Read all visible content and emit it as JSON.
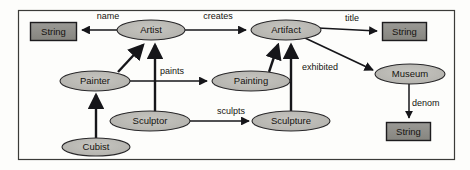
{
  "diagram": {
    "type": "entity-relationship-graph",
    "frame": {
      "name": "diagram-frame",
      "x": 18,
      "y": 10,
      "width": 436,
      "height": 150,
      "stroke": "#3b3b38",
      "fill": "#fdfdfb"
    },
    "colors": {
      "ellipse_fill": "#b9b8b3",
      "ellipse_stroke": "#29282a",
      "box_fill": "#8f8e8a",
      "box_stroke": "#1d1c1e",
      "edge_stroke": "#16161a",
      "text": "#15130f",
      "page_background": "#ffffff"
    },
    "nodes": [
      {
        "id": "string-name",
        "label": "String",
        "shape": "rectangle",
        "x": 30,
        "y": 22,
        "width": 46,
        "height": 18
      },
      {
        "id": "artist",
        "label": "Artist",
        "shape": "ellipse",
        "cx": 151,
        "cy": 30,
        "rx": 34,
        "ry": 10
      },
      {
        "id": "artifact",
        "label": "Artifact",
        "shape": "ellipse",
        "cx": 286,
        "cy": 30,
        "rx": 35,
        "ry": 10
      },
      {
        "id": "string-title",
        "label": "String",
        "shape": "rectangle",
        "x": 382,
        "y": 22,
        "width": 44,
        "height": 18
      },
      {
        "id": "painter",
        "label": "Painter",
        "shape": "ellipse",
        "cx": 95,
        "cy": 81,
        "rx": 35,
        "ry": 10
      },
      {
        "id": "painting",
        "label": "Painting",
        "shape": "ellipse",
        "cx": 251,
        "cy": 81,
        "rx": 39,
        "ry": 10
      },
      {
        "id": "museum",
        "label": "Museum",
        "shape": "ellipse",
        "cx": 410,
        "cy": 74,
        "rx": 35,
        "ry": 10
      },
      {
        "id": "sculptor",
        "label": "Sculptor",
        "shape": "ellipse",
        "cx": 150,
        "cy": 121,
        "rx": 40,
        "ry": 10
      },
      {
        "id": "sculpture",
        "label": "Sculpture",
        "shape": "ellipse",
        "cx": 291,
        "cy": 121,
        "rx": 39,
        "ry": 10
      },
      {
        "id": "string-denom",
        "label": "String",
        "shape": "rectangle",
        "x": 386,
        "y": 122,
        "width": 44,
        "height": 18
      },
      {
        "id": "cubist",
        "label": "Cubist",
        "shape": "ellipse",
        "cx": 96,
        "cy": 147,
        "rx": 34,
        "ry": 9
      }
    ],
    "edges": [
      {
        "id": "edge-name",
        "label": "name",
        "from": "artist",
        "to": "string-name",
        "label_x": 108,
        "label_y": 19
      },
      {
        "id": "edge-creates",
        "label": "creates",
        "from": "artist",
        "to": "artifact",
        "label_x": 218,
        "label_y": 19
      },
      {
        "id": "edge-title",
        "label": "title",
        "from": "artifact",
        "to": "string-title",
        "label_x": 352,
        "label_y": 21
      },
      {
        "id": "edge-exhibited",
        "label": "exhibited",
        "from": "artifact",
        "to": "museum",
        "label_x": 320,
        "label_y": 70
      },
      {
        "id": "edge-denom",
        "label": "denom",
        "from": "museum",
        "to": "string-denom",
        "label_x": 412,
        "label_y": 106
      },
      {
        "id": "edge-paints",
        "label": "paints",
        "from": "painter",
        "to": "painting",
        "label_x": 172,
        "label_y": 74
      },
      {
        "id": "edge-sculpts",
        "label": "sculpts",
        "from": "sculptor",
        "to": "sculpture",
        "label_x": 231,
        "label_y": 114
      },
      {
        "id": "edge-painter-isa-artist",
        "label": "",
        "from": "painter",
        "to": "artist",
        "label_x": 0,
        "label_y": 0
      },
      {
        "id": "edge-sculptor-isa-artist",
        "label": "",
        "from": "sculptor",
        "to": "artist",
        "label_x": 0,
        "label_y": 0
      },
      {
        "id": "edge-painting-isa-artifact",
        "label": "",
        "from": "painting",
        "to": "artifact",
        "label_x": 0,
        "label_y": 0
      },
      {
        "id": "edge-sculpture-isa-artifact",
        "label": "",
        "from": "sculpture",
        "to": "artifact",
        "label_x": 0,
        "label_y": 0
      },
      {
        "id": "edge-cubist-isa-painter",
        "label": "",
        "from": "cubist",
        "to": "painter",
        "label_x": 0,
        "label_y": 0
      }
    ]
  }
}
